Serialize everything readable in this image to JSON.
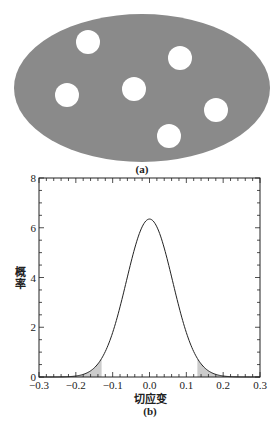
{
  "panel_a": {
    "caption": "(a)",
    "ellipse": {
      "cx": 142,
      "cy": 88,
      "rx": 128,
      "ry": 74,
      "fill": "#8a8a8a"
    },
    "hole_color": "#ffffff",
    "holes": [
      {
        "cx": 88,
        "cy": 42,
        "r": 12
      },
      {
        "cx": 180,
        "cy": 58,
        "r": 12
      },
      {
        "cx": 67,
        "cy": 95,
        "r": 12
      },
      {
        "cx": 134,
        "cy": 89,
        "r": 12
      },
      {
        "cx": 216,
        "cy": 110,
        "r": 12
      },
      {
        "cx": 169,
        "cy": 136,
        "r": 12
      }
    ]
  },
  "panel_b": {
    "caption": "(b)",
    "shade_color": "#cccccc",
    "line_color": "#222222"
  },
  "chart_data": {
    "type": "line",
    "title": "",
    "xlabel": "切应变",
    "ylabel": "概率",
    "xlim": [
      -0.3,
      0.3
    ],
    "ylim": [
      0,
      8
    ],
    "xticks": [
      -0.3,
      -0.2,
      -0.1,
      0.0,
      0.1,
      0.2,
      0.3
    ],
    "xtick_labels": [
      "−0.3",
      "−0.2",
      "−0.1",
      "0.0",
      "0.1",
      "0.2",
      "0.3"
    ],
    "yticks": [
      0,
      2,
      4,
      6,
      8
    ],
    "ytick_labels": [
      "0",
      "2",
      "4",
      "6",
      "8"
    ],
    "x_minor_step": 0.02,
    "y_minor_step": 0.5,
    "grid": false,
    "legend": null,
    "distribution": {
      "kind": "normal",
      "mean": 0.0,
      "std": 0.0628,
      "peak": 6.35
    },
    "shaded_tails": [
      {
        "from": -0.3,
        "to": -0.13
      },
      {
        "from": 0.13,
        "to": 0.3
      }
    ],
    "x": [
      -0.3,
      -0.28,
      -0.26,
      -0.24,
      -0.22,
      -0.2,
      -0.18,
      -0.16,
      -0.14,
      -0.13,
      -0.12,
      -0.1,
      -0.08,
      -0.06,
      -0.04,
      -0.02,
      0.0,
      0.02,
      0.04,
      0.06,
      0.08,
      0.1,
      0.12,
      0.13,
      0.14,
      0.16,
      0.18,
      0.2,
      0.22,
      0.24,
      0.26,
      0.28,
      0.3
    ],
    "values": [
      0.0,
      0.0,
      0.01,
      0.04,
      0.14,
      0.4,
      0.97,
      1.99,
      3.53,
      2.35,
      1.03,
      1.78,
      2.81,
      4.01,
      5.18,
      6.04,
      6.35,
      6.04,
      5.18,
      4.01,
      2.81,
      1.78,
      1.03,
      2.35,
      3.53,
      1.99,
      0.97,
      0.4,
      0.14,
      0.04,
      0.01,
      0.0,
      0.0
    ]
  }
}
